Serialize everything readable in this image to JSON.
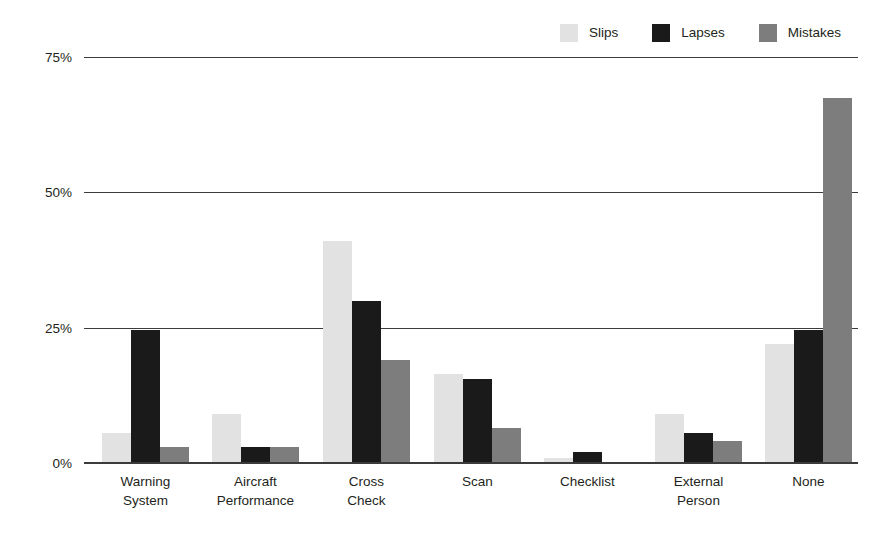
{
  "chart_data": {
    "type": "bar",
    "title": "",
    "subtitle": "",
    "xlabel": "",
    "ylabel": "",
    "ylim": [
      0,
      75
    ],
    "ytick_labels": [
      "0%",
      "25%",
      "50%",
      "75%"
    ],
    "ytick_values": [
      0,
      25,
      50,
      75
    ],
    "grid": true,
    "grid_axis": "y",
    "legend_position": "top-right",
    "categories": [
      "Warning\nSystem",
      "Aircraft\nPerformance",
      "Cross\nCheck",
      "Scan",
      "Checklist",
      "External\nPerson",
      "None"
    ],
    "series": [
      {
        "name": "Slips",
        "color": "#e2e2e2",
        "values": [
          5.5,
          9,
          41,
          16.5,
          1,
          9,
          22
        ]
      },
      {
        "name": "Lapses",
        "color": "#1a1a1a",
        "values": [
          24.5,
          3,
          30,
          15.5,
          2,
          5.5,
          24.5
        ]
      },
      {
        "name": "Mistakes",
        "color": "#7d7d7d",
        "values": [
          3,
          3,
          19,
          6.5,
          0,
          4,
          67.5
        ]
      }
    ]
  },
  "legend": {
    "items": [
      {
        "label": "Slips",
        "color": "#e2e2e2"
      },
      {
        "label": "Lapses",
        "color": "#1a1a1a"
      },
      {
        "label": "Mistakes",
        "color": "#7d7d7d"
      }
    ]
  },
  "axis": {
    "y_ticks": [
      {
        "label": "75%",
        "value": 75
      },
      {
        "label": "50%",
        "value": 50
      },
      {
        "label": "25%",
        "value": 25
      },
      {
        "label": "0%",
        "value": 0
      }
    ]
  },
  "colors": {
    "axis": "#3b3b3b",
    "text": "#231f20",
    "background": "#ffffff"
  }
}
